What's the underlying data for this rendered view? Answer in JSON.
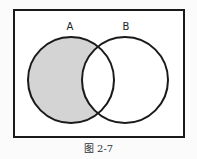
{
  "diagram": {
    "type": "venn",
    "sets": [
      {
        "label": "A",
        "shaded": "A only (A minus B)"
      },
      {
        "label": "B"
      }
    ],
    "shaded_region": "A − B",
    "colors": {
      "shade": "#d4d4d4",
      "stroke": "#1a1a1a",
      "background": "#ffffff"
    }
  },
  "labels": {
    "a": "A",
    "b": "B"
  },
  "caption": "图 2-7"
}
